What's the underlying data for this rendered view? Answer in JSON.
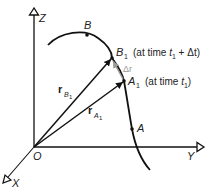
{
  "axes": {
    "x_label": "X",
    "y_label": "Y",
    "z_label": "Z",
    "origin_label": "O"
  },
  "points": {
    "B": "B",
    "B1_main": "B",
    "B1_sub": "1",
    "B1_note_prefix": "(at time ",
    "B1_note_t": "t",
    "B1_note_tsub": "1",
    "B1_note_suffix": " + Δt)",
    "A1_main": "A",
    "A1_sub": "1",
    "A1_note_prefix": "(at time ",
    "A1_note_t": "t",
    "A1_note_tsub": "1",
    "A1_note_suffix": ")",
    "A": "A"
  },
  "vectors": {
    "rB1_main": "r",
    "rB1_sub_letter": "B",
    "rB1_sub_num": "1",
    "rA1_main": "r",
    "rA1_sub_letter": "A",
    "rA1_sub_num": "1",
    "delta_r": "Δr"
  },
  "colors": {
    "line": "#111111",
    "delta_r": "#9a9a9a"
  }
}
